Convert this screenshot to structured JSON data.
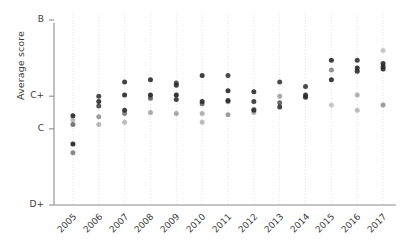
{
  "chart_data": {
    "type": "scatter",
    "title": "",
    "subtitle": "",
    "xlabel": "",
    "ylabel": "Average score",
    "grid": "vertical-dotted",
    "legend": "none",
    "categories": [
      "2005",
      "2006",
      "2007",
      "2008",
      "2009",
      "2010",
      "2011",
      "2012",
      "2013",
      "2014",
      "2015",
      "2016",
      "2017"
    ],
    "y_tick_labels": [
      "B",
      "C+",
      "C",
      "D+"
    ],
    "y_tick_values": [
      4.0,
      3.3,
      3.0,
      2.3
    ],
    "ylim": [
      2.3,
      4.0
    ],
    "y_axis_note": "Letter-grade scale, D+ at bottom through B at top",
    "series": [
      {
        "name": "2005",
        "x": "2005",
        "points": [
          {
            "score": 3.12,
            "opacity": 0.92
          },
          {
            "score": 3.08,
            "opacity": 0.3
          },
          {
            "score": 3.04,
            "opacity": 0.62
          },
          {
            "score": 2.86,
            "opacity": 0.95
          },
          {
            "score": 2.78,
            "opacity": 0.55
          }
        ]
      },
      {
        "name": "2006",
        "x": "2006",
        "points": [
          {
            "score": 3.3,
            "opacity": 0.85
          },
          {
            "score": 3.25,
            "opacity": 0.9
          },
          {
            "score": 3.21,
            "opacity": 0.8
          },
          {
            "score": 3.11,
            "opacity": 0.45
          },
          {
            "score": 3.04,
            "opacity": 0.32
          }
        ]
      },
      {
        "name": "2007",
        "x": "2007",
        "points": [
          {
            "score": 3.43,
            "opacity": 0.88
          },
          {
            "score": 3.31,
            "opacity": 0.92
          },
          {
            "score": 3.17,
            "opacity": 0.9
          },
          {
            "score": 3.14,
            "opacity": 0.55
          },
          {
            "score": 3.06,
            "opacity": 0.3
          }
        ]
      },
      {
        "name": "2008",
        "x": "2008",
        "points": [
          {
            "score": 3.45,
            "opacity": 0.9
          },
          {
            "score": 3.31,
            "opacity": 0.95
          },
          {
            "score": 3.28,
            "opacity": 0.7
          },
          {
            "score": 3.15,
            "opacity": 0.38
          }
        ]
      },
      {
        "name": "2009",
        "x": "2009",
        "points": [
          {
            "score": 3.42,
            "opacity": 0.8
          },
          {
            "score": 3.4,
            "opacity": 0.9
          },
          {
            "score": 3.31,
            "opacity": 0.95
          },
          {
            "score": 3.27,
            "opacity": 0.88
          },
          {
            "score": 3.14,
            "opacity": 0.4
          }
        ]
      },
      {
        "name": "2010",
        "x": "2010",
        "points": [
          {
            "score": 3.49,
            "opacity": 0.9
          },
          {
            "score": 3.25,
            "opacity": 0.92
          },
          {
            "score": 3.23,
            "opacity": 0.65
          },
          {
            "score": 3.14,
            "opacity": 0.35
          },
          {
            "score": 3.06,
            "opacity": 0.3
          }
        ]
      },
      {
        "name": "2011",
        "x": "2011",
        "points": [
          {
            "score": 3.49,
            "opacity": 0.85
          },
          {
            "score": 3.35,
            "opacity": 0.92
          },
          {
            "score": 3.26,
            "opacity": 0.9
          },
          {
            "score": 3.25,
            "opacity": 0.6
          },
          {
            "score": 3.13,
            "opacity": 0.45
          }
        ]
      },
      {
        "name": "2012",
        "x": "2012",
        "points": [
          {
            "score": 3.34,
            "opacity": 0.9
          },
          {
            "score": 3.25,
            "opacity": 0.88
          },
          {
            "score": 3.18,
            "opacity": 0.45
          },
          {
            "score": 3.17,
            "opacity": 0.88
          },
          {
            "score": 3.15,
            "opacity": 0.35
          }
        ]
      },
      {
        "name": "2013",
        "x": "2013",
        "points": [
          {
            "score": 3.43,
            "opacity": 0.85
          },
          {
            "score": 3.3,
            "opacity": 0.4
          },
          {
            "score": 3.24,
            "opacity": 0.7
          },
          {
            "score": 3.2,
            "opacity": 0.88
          }
        ]
      },
      {
        "name": "2014",
        "x": "2014",
        "points": [
          {
            "score": 3.39,
            "opacity": 0.85
          },
          {
            "score": 3.31,
            "opacity": 0.9
          },
          {
            "score": 3.29,
            "opacity": 0.92
          }
        ]
      },
      {
        "name": "2015",
        "x": "2015",
        "points": [
          {
            "score": 3.63,
            "opacity": 0.9
          },
          {
            "score": 3.54,
            "opacity": 0.5
          },
          {
            "score": 3.45,
            "opacity": 0.92
          },
          {
            "score": 3.22,
            "opacity": 0.25
          }
        ]
      },
      {
        "name": "2016",
        "x": "2016",
        "points": [
          {
            "score": 3.63,
            "opacity": 0.88
          },
          {
            "score": 3.56,
            "opacity": 0.92
          },
          {
            "score": 3.53,
            "opacity": 0.9
          },
          {
            "score": 3.31,
            "opacity": 0.35
          },
          {
            "score": 3.17,
            "opacity": 0.3
          }
        ]
      },
      {
        "name": "2017",
        "x": "2017",
        "points": [
          {
            "score": 3.72,
            "opacity": 0.25
          },
          {
            "score": 3.6,
            "opacity": 0.92
          },
          {
            "score": 3.57,
            "opacity": 0.95
          },
          {
            "score": 3.55,
            "opacity": 0.9
          },
          {
            "score": 3.22,
            "opacity": 0.45
          }
        ]
      }
    ]
  },
  "axes": {
    "y_title": "Average score",
    "y_labels": [
      "B",
      "C+",
      "C",
      "D+"
    ],
    "x_labels": [
      "2005",
      "2006",
      "2007",
      "2008",
      "2009",
      "2010",
      "2011",
      "2012",
      "2013",
      "2014",
      "2015",
      "2016",
      "2017"
    ]
  },
  "colors": {
    "dot": "#2b2b2b",
    "axis": "#8c8c8c",
    "grid": "#e2e2e2",
    "text": "#3d3d3d",
    "background": "#ffffff"
  }
}
